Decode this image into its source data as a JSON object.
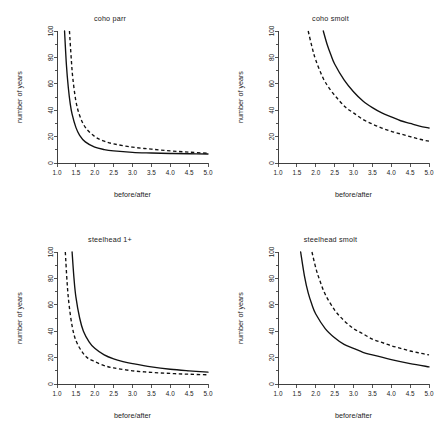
{
  "figure": {
    "title": "",
    "layout": "2x2 panel grid",
    "background": "#ffffff",
    "line_color": "#111111"
  },
  "axis": {
    "xlabel": "before/after",
    "ylabel": "number of years",
    "x_ticklabels": [
      "1.0",
      "1.5",
      "2.0",
      "2.5",
      "3.0",
      "3.5",
      "4.0",
      "4.5",
      "5.0"
    ],
    "x_tickvalues": [
      1.0,
      1.5,
      2.0,
      2.5,
      3.0,
      3.5,
      4.0,
      4.5,
      5.0
    ],
    "y_ticklabels": [
      "0",
      "20",
      "40",
      "60",
      "80",
      "100"
    ],
    "y_tickvalues": [
      0,
      20,
      40,
      60,
      80,
      100
    ],
    "y_minor_tickvalues": [
      10,
      30,
      50,
      70,
      90
    ],
    "xlim": [
      1.0,
      5.0
    ],
    "ylim": [
      0,
      100
    ]
  },
  "panels": [
    {
      "id": "coho-parr",
      "title": "coho parr",
      "position": "top-left"
    },
    {
      "id": "coho-smolt",
      "title": "coho smolt",
      "position": "top-right"
    },
    {
      "id": "steelhead-1plus",
      "title": "steelhead 1+",
      "position": "bottom-left"
    },
    {
      "id": "steelhead-smolt",
      "title": "steelhead smolt",
      "position": "bottom-right"
    }
  ],
  "chart_data": [
    {
      "type": "line",
      "title": "coho parr",
      "xlabel": "before/after",
      "ylabel": "number of years",
      "xlim": [
        1.0,
        5.0
      ],
      "ylim": [
        0,
        100
      ],
      "grid": false,
      "legend": "none",
      "series": [
        {
          "name": "solid",
          "style": "solid",
          "x": [
            1.2,
            1.25,
            1.3,
            1.35,
            1.4,
            1.5,
            1.6,
            1.75,
            2.0,
            2.25,
            2.5,
            3.0,
            3.5,
            4.0,
            4.5,
            5.0
          ],
          "values": [
            100,
            74,
            57,
            45,
            37,
            27,
            21,
            16,
            12,
            10.2,
            9.2,
            8.1,
            7.6,
            7.2,
            7.0,
            6.8
          ]
        },
        {
          "name": "dashed",
          "style": "dashed",
          "x": [
            1.33,
            1.38,
            1.42,
            1.5,
            1.6,
            1.75,
            2.0,
            2.25,
            2.5,
            3.0,
            3.5,
            4.0,
            4.5,
            5.0
          ],
          "values": [
            100,
            78,
            64,
            47,
            36,
            27,
            20,
            16.5,
            14.5,
            12.0,
            10.5,
            9.2,
            8.2,
            7.4
          ]
        }
      ]
    },
    {
      "type": "line",
      "title": "coho smolt",
      "xlabel": "before/after",
      "ylabel": "number of years",
      "xlim": [
        1.0,
        5.0
      ],
      "ylim": [
        0,
        100
      ],
      "grid": false,
      "legend": "none",
      "series": [
        {
          "name": "solid",
          "style": "solid",
          "x": [
            2.2,
            2.3,
            2.4,
            2.5,
            2.75,
            3.0,
            3.25,
            3.5,
            3.75,
            4.0,
            4.25,
            4.5,
            4.75,
            5.0
          ],
          "values": [
            100,
            90,
            82,
            75,
            63,
            54,
            47,
            42,
            38,
            35,
            32,
            30,
            28,
            26.5
          ]
        },
        {
          "name": "dashed",
          "style": "dashed",
          "x": [
            1.8,
            1.9,
            2.0,
            2.2,
            2.4,
            2.6,
            2.8,
            3.0,
            3.25,
            3.5,
            3.75,
            4.0,
            4.25,
            4.5,
            4.75,
            5.0
          ],
          "values": [
            100,
            88,
            78,
            64,
            55,
            48,
            42,
            38,
            33,
            29.5,
            26.5,
            24,
            22,
            20,
            18,
            16.5
          ]
        }
      ]
    },
    {
      "type": "line",
      "title": "steelhead 1+",
      "xlabel": "before/after",
      "ylabel": "number of years",
      "xlim": [
        1.0,
        5.0
      ],
      "ylim": [
        0,
        100
      ],
      "grid": false,
      "legend": "none",
      "series": [
        {
          "name": "solid",
          "style": "solid",
          "x": [
            1.4,
            1.45,
            1.5,
            1.6,
            1.7,
            1.85,
            2.0,
            2.25,
            2.5,
            2.75,
            3.0,
            3.5,
            4.0,
            4.5,
            5.0
          ],
          "values": [
            100,
            80,
            66,
            50,
            40,
            32,
            27,
            22,
            19,
            17,
            15.5,
            13.0,
            11.2,
            10.0,
            9.0
          ]
        },
        {
          "name": "dashed",
          "style": "dashed",
          "x": [
            1.22,
            1.27,
            1.32,
            1.4,
            1.5,
            1.65,
            1.8,
            2.0,
            2.25,
            2.5,
            3.0,
            3.5,
            4.0,
            4.5,
            5.0
          ],
          "values": [
            100,
            76,
            60,
            44,
            33,
            25,
            20,
            17,
            14,
            12.2,
            10.0,
            8.8,
            8.0,
            7.4,
            7.0
          ]
        }
      ]
    },
    {
      "type": "line",
      "title": "steelhead smolt",
      "xlabel": "before/after",
      "ylabel": "number of years",
      "xlim": [
        1.0,
        5.0
      ],
      "ylim": [
        0,
        100
      ],
      "grid": false,
      "legend": "none",
      "series": [
        {
          "name": "solid",
          "style": "solid",
          "x": [
            1.6,
            1.7,
            1.8,
            1.9,
            2.0,
            2.25,
            2.5,
            2.75,
            3.0,
            3.25,
            3.5,
            4.0,
            4.5,
            5.0
          ],
          "values": [
            100,
            82,
            69,
            60,
            53,
            42,
            35,
            30,
            27,
            24,
            22,
            18.5,
            15.5,
            13.0
          ]
        },
        {
          "name": "dashed",
          "style": "dashed",
          "x": [
            1.9,
            2.0,
            2.1,
            2.25,
            2.5,
            2.75,
            3.0,
            3.25,
            3.5,
            3.75,
            4.0,
            4.25,
            4.5,
            4.75,
            5.0
          ],
          "values": [
            100,
            88,
            79,
            68,
            56,
            48,
            42,
            38,
            34,
            31.5,
            29,
            27,
            25,
            23.5,
            22
          ]
        }
      ]
    }
  ]
}
